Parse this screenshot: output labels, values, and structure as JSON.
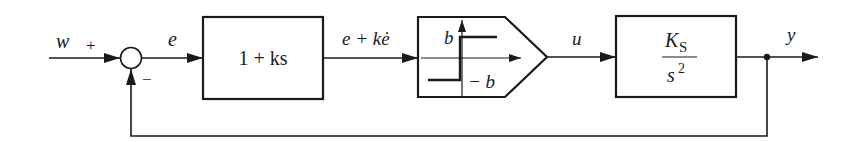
{
  "diagram": {
    "type": "control-loop-block-diagram",
    "colors": {
      "stroke": "#1a1a1a",
      "background": "#ffffff"
    },
    "signals": {
      "reference": "w",
      "error": "e",
      "pd_output": "e + kė",
      "control": "u",
      "output": "y"
    },
    "summing_junction": {
      "plus_sign": "+",
      "minus_sign": "−"
    },
    "blocks": {
      "controller": {
        "label": "1 + ks"
      },
      "relay": {
        "upper_level": "b",
        "lower_level": "− b"
      },
      "plant": {
        "numerator_main": "K",
        "numerator_sub": "S",
        "denominator_main": "s",
        "denominator_sup": "2"
      }
    }
  }
}
